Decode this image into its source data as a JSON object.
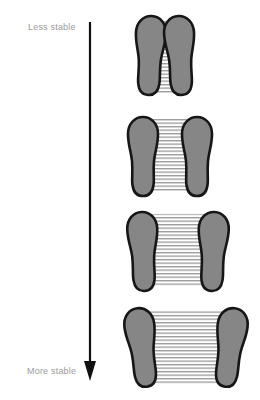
{
  "diagram": {
    "type": "stability-of-stance",
    "labels": {
      "top": "Less stable",
      "bottom": "More stable"
    },
    "arrow": {
      "direction": "down",
      "from": "Less stable",
      "to": "More stable"
    },
    "stances": [
      {
        "order": 1,
        "stance": "feet together, toes touching",
        "base_of_support": "narrowest"
      },
      {
        "order": 2,
        "stance": "feet slightly apart",
        "base_of_support": "narrow"
      },
      {
        "order": 3,
        "stance": "feet apart",
        "base_of_support": "wide"
      },
      {
        "order": 4,
        "stance": "feet wide apart, toes turned out",
        "base_of_support": "widest"
      }
    ]
  },
  "colors": {
    "background": "#ffffff",
    "foot-fill": "#868686",
    "foot-outline": "#161616",
    "hatch-line": "#4a4a4a",
    "label-text": "#9b9b9b",
    "arrow": "#111111"
  }
}
